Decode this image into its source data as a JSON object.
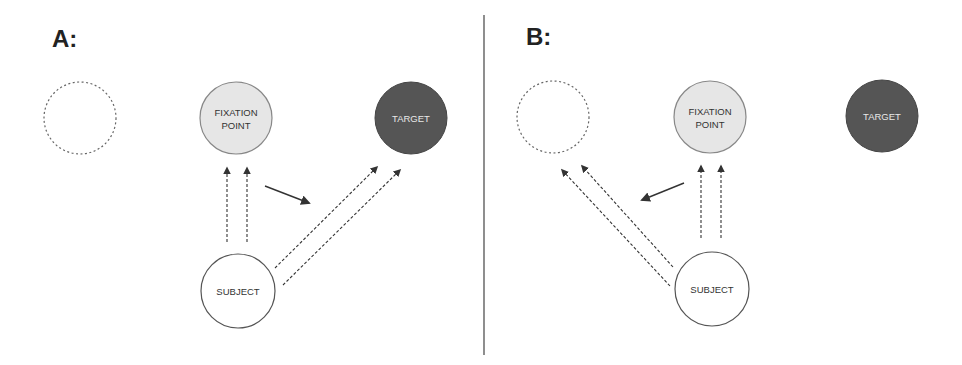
{
  "colors": {
    "background": "#ffffff",
    "ink": "#333333",
    "fixation_fill": "#e6e6e6",
    "target_fill": "#555555",
    "target_text": "#e8e8e8",
    "node_text": "#333333",
    "dashed_circle": "#666666"
  },
  "panels": [
    {
      "label": "A:",
      "nodes": {
        "placeholder": {
          "label": ""
        },
        "fixation": {
          "line1": "FIXATION",
          "line2": "POINT"
        },
        "target": {
          "label": "TARGET"
        },
        "subject": {
          "label": "SUBJECT"
        }
      },
      "description": "Gaze from subject to fixation point, then shift toward target (prosaccade)"
    },
    {
      "label": "B:",
      "nodes": {
        "placeholder": {
          "label": ""
        },
        "fixation": {
          "line1": "FIXATION",
          "line2": "POINT"
        },
        "target": {
          "label": "TARGET"
        },
        "subject": {
          "label": "SUBJECT"
        }
      },
      "description": "Gaze from subject to fixation point, then shift away from target to mirror location (antisaccade)"
    }
  ]
}
